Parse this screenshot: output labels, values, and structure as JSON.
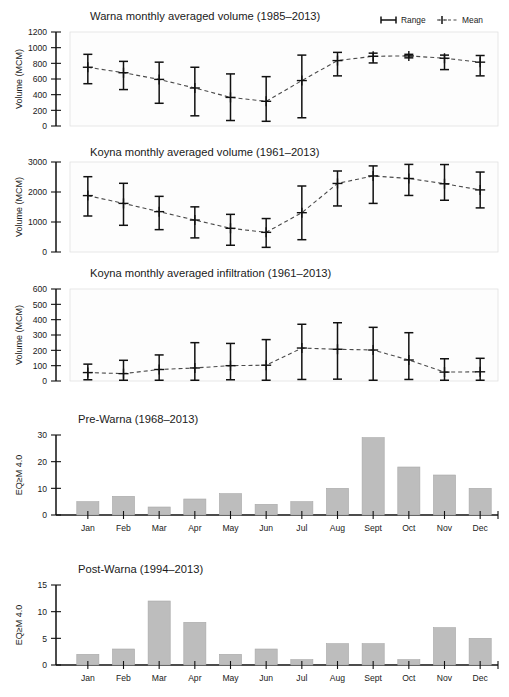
{
  "figure": {
    "months": [
      "Jan",
      "Feb",
      "Mar",
      "Apr",
      "May",
      "Jun",
      "Jul",
      "Aug",
      "Sept",
      "Oct",
      "Nov",
      "Dec"
    ],
    "legend": {
      "range_label": "Range",
      "mean_label": "Mean",
      "range_icon": "error-bar-icon",
      "mean_icon": "dashed-plus-marker-icon"
    },
    "colors": {
      "bar_fill": "#bdbdbd",
      "axis": "#111111",
      "mean_line": "#4a4a4a",
      "plot_background": "#fdfdfd"
    }
  },
  "chart_data": [
    {
      "type": "line",
      "panel_id": "warna-volume",
      "title": "Warna monthly averaged volume (1985–2013)",
      "xlabel": "",
      "ylabel": "Volume (MCM)",
      "ylim": [
        0,
        1200
      ],
      "yticks": [
        0,
        200,
        400,
        600,
        800,
        1000,
        1200
      ],
      "ytick_labels": [
        "0",
        "200",
        "400",
        "600",
        "800",
        "1000",
        "1200"
      ],
      "grid": false,
      "legend_position": "top-right",
      "categories": [
        "Jan",
        "Feb",
        "Mar",
        "Apr",
        "May",
        "Jun",
        "Jul",
        "Aug",
        "Sept",
        "Oct",
        "Nov",
        "Dec"
      ],
      "series": [
        {
          "name": "Mean",
          "values": [
            750,
            680,
            595,
            485,
            365,
            315,
            580,
            835,
            890,
            895,
            865,
            815
          ]
        },
        {
          "name": "Range low",
          "values": [
            540,
            465,
            290,
            130,
            70,
            60,
            105,
            640,
            805,
            870,
            720,
            640
          ]
        },
        {
          "name": "Range high",
          "values": [
            915,
            825,
            815,
            750,
            665,
            630,
            905,
            940,
            930,
            915,
            905,
            900
          ]
        }
      ]
    },
    {
      "type": "line",
      "panel_id": "koyna-volume",
      "title": "Koyna monthly averaged volume (1961–2013)",
      "xlabel": "",
      "ylabel": "Volume (MCM)",
      "ylim": [
        0,
        3000
      ],
      "yticks": [
        0,
        1000,
        2000,
        3000
      ],
      "ytick_labels": [
        "0",
        "1000",
        "2000",
        "3000"
      ],
      "grid": false,
      "legend_position": "none",
      "categories": [
        "Jan",
        "Feb",
        "Mar",
        "Apr",
        "May",
        "Jun",
        "Jul",
        "Aug",
        "Sept",
        "Oct",
        "Nov",
        "Dec"
      ],
      "series": [
        {
          "name": "Mean",
          "values": [
            1880,
            1620,
            1345,
            1065,
            790,
            655,
            1310,
            2285,
            2535,
            2450,
            2275,
            2070
          ]
        },
        {
          "name": "Range low",
          "values": [
            1200,
            890,
            745,
            470,
            225,
            155,
            410,
            1535,
            1620,
            1885,
            1725,
            1470
          ]
        },
        {
          "name": "Range high",
          "values": [
            2510,
            2290,
            1855,
            1505,
            1255,
            1115,
            2200,
            2700,
            2870,
            2920,
            2915,
            2665
          ]
        }
      ]
    },
    {
      "type": "line",
      "panel_id": "koyna-infiltration",
      "title": "Koyna monthly averaged infiltration (1961–2013)",
      "xlabel": "",
      "ylabel": "Volume (MCM)",
      "ylim": [
        0,
        600
      ],
      "yticks": [
        0,
        100,
        200,
        300,
        400,
        500,
        600
      ],
      "ytick_labels": [
        "0",
        "100",
        "200",
        "300",
        "400",
        "500",
        "600"
      ],
      "grid": false,
      "legend_position": "none",
      "categories": [
        "Jan",
        "Feb",
        "Mar",
        "Apr",
        "May",
        "Jun",
        "Jul",
        "Aug",
        "Sept",
        "Oct",
        "Nov",
        "Dec"
      ],
      "series": [
        {
          "name": "Mean",
          "values": [
            55,
            48,
            75,
            85,
            100,
            103,
            215,
            207,
            202,
            137,
            58,
            60
          ]
        },
        {
          "name": "Range low",
          "values": [
            8,
            5,
            5,
            5,
            8,
            5,
            10,
            12,
            5,
            10,
            5,
            5
          ]
        },
        {
          "name": "Range high",
          "values": [
            110,
            135,
            170,
            250,
            245,
            270,
            370,
            380,
            350,
            315,
            145,
            148
          ]
        }
      ]
    },
    {
      "type": "bar",
      "panel_id": "pre-warna",
      "title": "Pre-Warna (1968–2013)",
      "xlabel": "",
      "ylabel": "EQ≥M 4.0",
      "ylim": [
        0,
        30
      ],
      "yticks": [
        0,
        10,
        20,
        30
      ],
      "ytick_labels": [
        "0",
        "10",
        "20",
        "30"
      ],
      "grid": false,
      "legend_position": "none",
      "categories": [
        "Jan",
        "Feb",
        "Mar",
        "Apr",
        "May",
        "Jun",
        "Jul",
        "Aug",
        "Sept",
        "Oct",
        "Nov",
        "Dec"
      ],
      "values": [
        5,
        7,
        3,
        6,
        8,
        4,
        5,
        10,
        29,
        18,
        15,
        10
      ]
    },
    {
      "type": "bar",
      "panel_id": "post-warna",
      "title": "Post-Warna (1994–2013)",
      "xlabel": "",
      "ylabel": "EQ≥M 4.0",
      "ylim": [
        0,
        15
      ],
      "yticks": [
        0,
        5,
        10,
        15
      ],
      "ytick_labels": [
        "0",
        "5",
        "10",
        "15"
      ],
      "grid": false,
      "legend_position": "none",
      "categories": [
        "Jan",
        "Feb",
        "Mar",
        "Apr",
        "May",
        "Jun",
        "Jul",
        "Aug",
        "Sept",
        "Oct",
        "Nov",
        "Dec"
      ],
      "values": [
        2,
        3,
        12,
        8,
        2,
        3,
        1,
        4,
        4,
        1,
        7,
        5
      ]
    }
  ]
}
